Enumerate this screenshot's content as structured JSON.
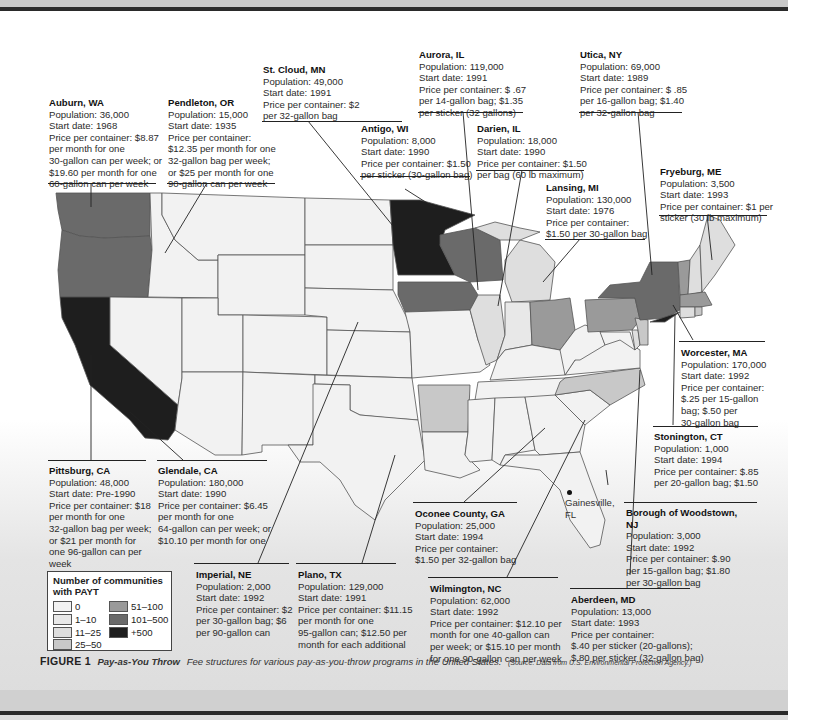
{
  "figure": {
    "label": "FIGURE 1",
    "title": "Pay-as-You Throw",
    "description": "Fee structures for various pay-as-you-throw programs in the United States.",
    "source": "(Source: Data from U.S. Environmental Protection Agency.)"
  },
  "legend": {
    "title": "Number of communities with PAYT",
    "items": [
      {
        "label": "0",
        "color": "#f2f2f2"
      },
      {
        "label": "1–10",
        "color": "#e8e8e8"
      },
      {
        "label": "11–25",
        "color": "#dedede"
      },
      {
        "label": "25–50",
        "color": "#c8c8c8"
      },
      {
        "label": "51–100",
        "color": "#9a9a9a"
      },
      {
        "label": "101–500",
        "color": "#6a6a6a"
      },
      {
        "label": "+500",
        "color": "#1e1e1e"
      }
    ]
  },
  "marker": {
    "label_line1": "Gainesville,",
    "label_line2": "FL"
  },
  "callouts": [
    {
      "id": "auburn",
      "title": "Auburn, WA",
      "lines": [
        "Population: 36,000",
        "Start date: 1968",
        "Price per container: $8.87",
        "per month for one",
        "30-gallon can per week; or",
        "$19.60 per month for one",
        "60-gallon can per week"
      ]
    },
    {
      "id": "pendleton",
      "title": "Pendleton, OR",
      "lines": [
        "Population: 15,000",
        "Start date: 1935",
        "Price per container:",
        "$12.35 per month for one",
        "32-gallon bag per week;",
        "or $25 per month for one",
        "90-gallon can per week"
      ]
    },
    {
      "id": "stcloud",
      "title": "St. Cloud, MN",
      "lines": [
        "Population: 49,000",
        "Start date: 1991",
        "Price per container: $2",
        "per 32-gallon bag"
      ]
    },
    {
      "id": "antigo",
      "title": "Antigo, WI",
      "lines": [
        "Population: 8,000",
        "Start date: 1990",
        "Price per container: $1.50",
        "per sticker (30-gallon bag)"
      ]
    },
    {
      "id": "aurora",
      "title": "Aurora, IL",
      "lines": [
        "Population: 119,000",
        "Start date: 1991",
        "Price per container: $ .67",
        "per 14-gallon bag; $1.35",
        "per sticker (32 gallons)"
      ]
    },
    {
      "id": "darien",
      "title": "Darien, IL",
      "lines": [
        "Population: 18,000",
        "Start date: 1990",
        "Price per container: $1.50",
        "per bag (60 lb maximum)"
      ]
    },
    {
      "id": "utica",
      "title": "Utica, NY",
      "lines": [
        "Population: 69,000",
        "Start date: 1989",
        "Price per container: $ .85",
        "per 16-gallon bag; $1.40",
        "per 32-gallon bag"
      ]
    },
    {
      "id": "lansing",
      "title": "Lansing, MI",
      "lines": [
        "Population: 130,000",
        "Start date: 1976",
        "Price per container:",
        "$1.50 per 30-gallon bag"
      ]
    },
    {
      "id": "fryeburg",
      "title": "Fryeburg, ME",
      "lines": [
        "Population: 3,500",
        "Start date: 1993",
        "Price per container: $1 per",
        "sticker (30 lb maximum)"
      ]
    },
    {
      "id": "worcester",
      "title": "Worcester, MA",
      "lines": [
        "Population: 170,000",
        "Start date: 1992",
        "Price per container:",
        "$.25 per 15-gallon",
        "bag; $.50 per",
        "30-gallon bag"
      ]
    },
    {
      "id": "stonington",
      "title": "Stonington, CT",
      "lines": [
        "Population: 1,000",
        "Start date: 1994",
        "Price per container: $.85",
        "per 20-gallon bag; $1.50",
        "per 34-gallon bag"
      ]
    },
    {
      "id": "woodstown",
      "title": "Borough of Woodstown,",
      "title2": "NJ",
      "lines": [
        "Population: 3,000",
        "Start date: 1992",
        "Price per container: $.90",
        "per 15-gallon bag; $1.80",
        "per 30-gallon bag"
      ]
    },
    {
      "id": "pittsburg",
      "title": "Pittsburg, CA",
      "lines": [
        "Population: 48,000",
        "Start date: Pre-1990",
        "Price per container: $18",
        "per month for one",
        "32-gallon bag per week;",
        "or $21 per month for",
        "one 96-gallon can per",
        "week"
      ]
    },
    {
      "id": "glendale",
      "title": "Glendale, CA",
      "lines": [
        "Population: 180,000",
        "Start date: 1990",
        "Price per container: $6.45",
        "per month for one",
        "64-gallon can per week; or",
        "$10.10 per month for one",
        "100-gallon can per week"
      ]
    },
    {
      "id": "oconee",
      "title": "Oconee County, GA",
      "lines": [
        "Population: 25,000",
        "Start date: 1994",
        "Price per container:",
        "$1.50 per 32-gallon bag"
      ]
    },
    {
      "id": "imperial",
      "title": "Imperial, NE",
      "lines": [
        "Population: 2,000",
        "Start date: 1992",
        "Price per container: $2",
        "per 30-gallon bag; $6",
        "per 90-gallon can"
      ]
    },
    {
      "id": "plano",
      "title": "Plano, TX",
      "lines": [
        "Population: 129,000",
        "Start date: 1991",
        "Price per container: $11.15",
        "per month for one",
        "95-gallon can; $12.50 per",
        "month for each additional",
        "95-gallon can"
      ]
    },
    {
      "id": "wilmington",
      "title": "Wilmington, NC",
      "lines": [
        "Population: 62,000",
        "Start date: 1992",
        "Price per container: $12.10 per",
        "month for one 40-gallon can",
        "per week; or $15.10 per month",
        "for one 90-gallon can per week"
      ]
    },
    {
      "id": "aberdeen",
      "title": "Aberdeen, MD",
      "lines": [
        "Population: 13,000",
        "Start date: 1993",
        "Price per container:",
        "$.40 per sticker (20-gallons);",
        "$.80 per sticker (32-gallon bag)"
      ]
    }
  ]
}
